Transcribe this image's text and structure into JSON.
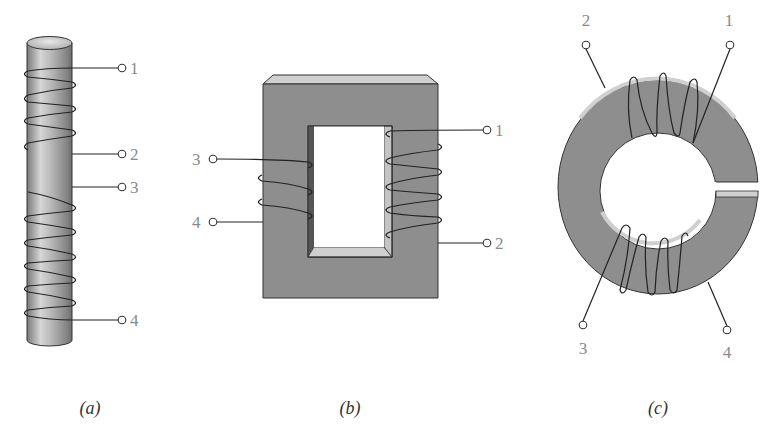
{
  "figure": {
    "panels": [
      {
        "id": "a",
        "caption": "(a)",
        "description": "Cylindrical rod core with two separate windings",
        "terminals": [
          {
            "label": "1"
          },
          {
            "label": "2"
          },
          {
            "label": "3"
          },
          {
            "label": "4"
          }
        ]
      },
      {
        "id": "b",
        "caption": "(b)",
        "description": "Rectangular core with windings on both legs",
        "terminals": [
          {
            "label": "1"
          },
          {
            "label": "2"
          },
          {
            "label": "3"
          },
          {
            "label": "4"
          }
        ]
      },
      {
        "id": "c",
        "caption": "(c)",
        "description": "Toroidal core with gap and two windings",
        "terminals": [
          {
            "label": "1"
          },
          {
            "label": "2"
          },
          {
            "label": "3"
          },
          {
            "label": "4"
          }
        ]
      }
    ]
  },
  "colors": {
    "core": "#8e8e8e",
    "core_light": "#d2d2d2",
    "core_dark": "#5a5a5a",
    "wire": "#222222",
    "label": "#8a8a8a"
  }
}
